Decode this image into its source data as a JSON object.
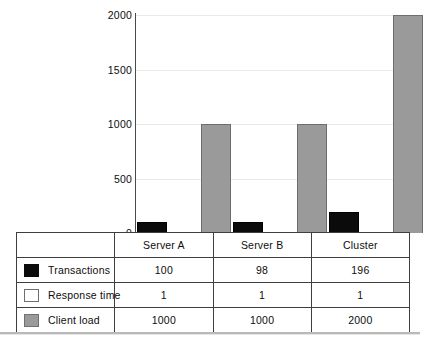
{
  "chart_data": {
    "type": "bar",
    "title": "",
    "xlabel": "",
    "ylabel": "",
    "categories": [
      "Server A",
      "Server B",
      "Cluster"
    ],
    "series": [
      {
        "name": "Transactions",
        "values": [
          100,
          98,
          196
        ],
        "color": "#0b0b0b"
      },
      {
        "name": "Response time",
        "values": [
          1,
          1,
          1
        ],
        "color": "#e3e3e3"
      },
      {
        "name": "Client load",
        "values": [
          1000,
          1000,
          2000
        ],
        "color": "#9a9a9a"
      }
    ],
    "ylim": [
      0,
      2000
    ],
    "yticks": [
      "0",
      "500",
      "1000",
      "1500",
      "2000"
    ],
    "ytick_values": [
      0,
      500,
      1000,
      1500,
      2000
    ],
    "grid": true,
    "legend_position": "table-below"
  },
  "table": {
    "header": {
      "legend_label": "",
      "columns": [
        "Server A",
        "Server B",
        "Cluster"
      ]
    },
    "rows": [
      {
        "swatch": "black-swatch-icon",
        "label": "Transactions",
        "values": [
          "100",
          "98",
          "196"
        ]
      },
      {
        "swatch": "light-gray-swatch-icon",
        "label": "Response time",
        "values": [
          "1",
          "1",
          "1"
        ]
      },
      {
        "swatch": "mid-gray-swatch-icon",
        "label": "Client load",
        "values": [
          "1000",
          "1000",
          "2000"
        ]
      }
    ]
  }
}
